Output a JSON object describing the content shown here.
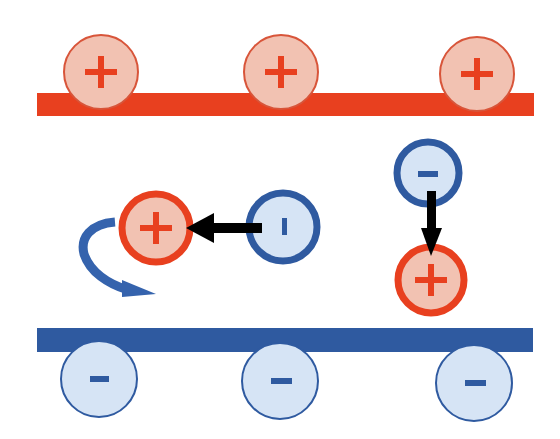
{
  "diagram": {
    "colors": {
      "positive_plate": "#e8401f",
      "positive_fill": "#f2c2b2",
      "positive_stroke_thin": "#d8553a",
      "negative_plate": "#2f5aa0",
      "negative_fill": "#d6e4f5",
      "negative_stroke": "#2f5aa0",
      "arrow": "#000000",
      "rotation_arrow": "#3563ad"
    },
    "top_plate": {
      "charge": "+",
      "charges": [
        "+",
        "+",
        "+"
      ]
    },
    "bottom_plate": {
      "charge": "-",
      "charges": [
        "−",
        "−",
        "−"
      ]
    },
    "free_pair_horizontal": {
      "positive": "+",
      "negative": "−"
    },
    "free_pair_vertical": {
      "positive": "+",
      "negative": "−"
    }
  }
}
